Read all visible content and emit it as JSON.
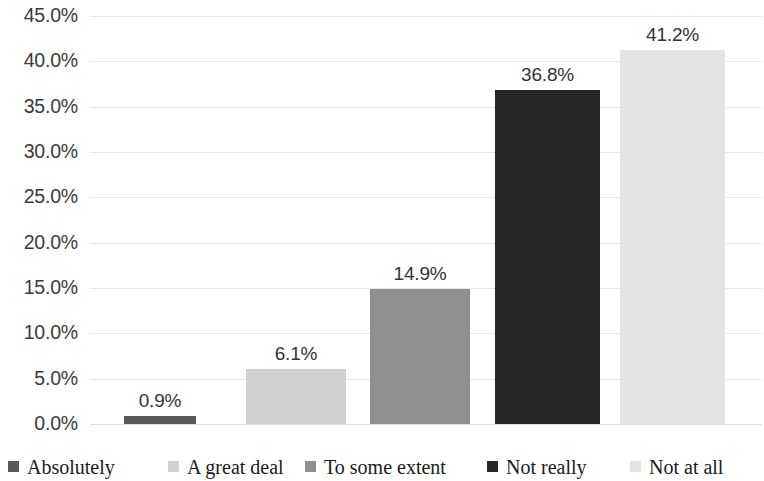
{
  "chart_data": {
    "type": "bar",
    "title": "",
    "subtitle": "",
    "xlabel": "",
    "ylabel": "",
    "categories": [
      "Absolutely",
      "A great deal",
      "To some extent",
      "Not really",
      "Not at all"
    ],
    "values": [
      0.9,
      6.1,
      14.9,
      36.8,
      41.2
    ],
    "data_labels": [
      "0.9%",
      "6.1%",
      "14.9%",
      "36.8%",
      "41.2%"
    ],
    "colors": [
      "#595959",
      "#d0d0d0",
      "#8f8f8f",
      "#262626",
      "#e3e3e3"
    ],
    "ylim": [
      0,
      45
    ],
    "ytick_values": [
      45,
      40,
      35,
      30,
      25,
      20,
      15,
      10,
      5,
      0
    ],
    "ytick_labels": [
      "45.0%",
      "40.0%",
      "35.0%",
      "30.0%",
      "25.0%",
      "20.0%",
      "15.0%",
      "10.0%",
      "5.0%",
      "0.0%"
    ],
    "xtick_labels": [],
    "grid": true,
    "grid_axis": "y",
    "grid_color": "#e8e8e8",
    "legend_position": "bottom",
    "legend_entries": [
      {
        "label": "Absolutely",
        "color": "#595959"
      },
      {
        "label": "A great deal",
        "color": "#d0d0d0"
      },
      {
        "label": "To some extent",
        "color": "#8f8f8f"
      },
      {
        "label": "Not really",
        "color": "#262626"
      },
      {
        "label": "Not at all",
        "color": "#e3e3e3"
      }
    ],
    "background_color": "#ffffff",
    "axis_text_color": "#3b3b3b",
    "label_text_color": "#333333"
  }
}
